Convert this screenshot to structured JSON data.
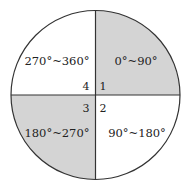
{
  "diagram": {
    "type": "quadrant-circle",
    "colors": {
      "shaded": "#d4d4d4",
      "unshaded": "#ffffff",
      "stroke": "#333333"
    },
    "quadrants": [
      {
        "number": "1",
        "range": "0°~90°",
        "shaded": true,
        "position": "top-right"
      },
      {
        "number": "2",
        "range": "90°~180°",
        "shaded": false,
        "position": "bottom-right"
      },
      {
        "number": "3",
        "range": "180°~270°",
        "shaded": true,
        "position": "bottom-left"
      },
      {
        "number": "4",
        "range": "270°~360°",
        "shaded": false,
        "position": "top-left"
      }
    ]
  }
}
